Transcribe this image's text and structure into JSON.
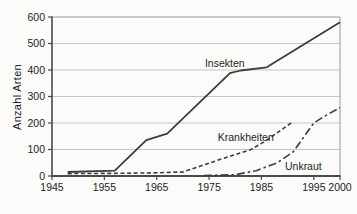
{
  "figure": {
    "title": "",
    "background": "#fbfbf9"
  },
  "colors": {
    "series_line": "#3d3d3d",
    "gridline": "#c6c6c6",
    "frame_dark": "#4a4a4a",
    "frame_light": "#9a9a9a",
    "text": "#1e1e1e"
  },
  "chart_data": {
    "type": "line",
    "title": "",
    "xlabel": "",
    "ylabel": "Anzahl Arten",
    "xlim": [
      1945,
      2000
    ],
    "ylim": [
      0,
      600
    ],
    "x_ticks": [
      1945,
      1955,
      1965,
      1975,
      1985,
      1995,
      2000
    ],
    "y_ticks": [
      0,
      100,
      200,
      300,
      400,
      500,
      600
    ],
    "grid": "horizontal",
    "legend_position": "inline-labels",
    "series": [
      {
        "name": "Insekten",
        "style": "solid",
        "points": [
          [
            1948,
            15
          ],
          [
            1957,
            20
          ],
          [
            1963,
            135
          ],
          [
            1967,
            160
          ],
          [
            1979,
            388
          ],
          [
            1981,
            398
          ],
          [
            1986,
            410
          ],
          [
            1993,
            495
          ],
          [
            2000,
            580
          ]
        ],
        "label_pos": [
          1978,
          425
        ]
      },
      {
        "name": "Krankheiten",
        "style": "dashed",
        "points": [
          [
            1948,
            9
          ],
          [
            1958,
            10
          ],
          [
            1965,
            12
          ],
          [
            1970,
            15
          ],
          [
            1976,
            55
          ],
          [
            1983,
            100
          ],
          [
            1986,
            135
          ],
          [
            1991,
            205
          ]
        ],
        "label_pos": [
          1982,
          145
        ]
      },
      {
        "name": "Unkraut",
        "style": "dashdot",
        "points": [
          [
            1974,
            2
          ],
          [
            1980,
            5
          ],
          [
            1984,
            20
          ],
          [
            1988,
            50
          ],
          [
            1991,
            90
          ],
          [
            1995,
            200
          ],
          [
            1997,
            225
          ],
          [
            2000,
            258
          ]
        ],
        "label_pos": [
          1993,
          35
        ]
      }
    ]
  }
}
